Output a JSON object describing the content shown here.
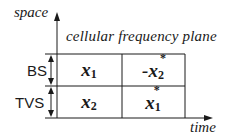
{
  "diagram": {
    "axes": {
      "y_label": "space",
      "x_label": "time"
    },
    "plane_title": "cellular frequency plane",
    "rows": [
      {
        "label": "BS"
      },
      {
        "label": "TVS"
      }
    ],
    "cells": [
      [
        {
          "base": "x",
          "sub": "1",
          "sup": "",
          "prefix": ""
        },
        {
          "base": "x",
          "sub": "2",
          "sup": "*",
          "prefix": "-"
        }
      ],
      [
        {
          "base": "x",
          "sub": "2",
          "sup": "",
          "prefix": ""
        },
        {
          "base": "x",
          "sub": "1",
          "sup": "*",
          "prefix": ""
        }
      ]
    ],
    "colors": {
      "line": "#1a1a1a",
      "background": "#ffffff"
    }
  }
}
